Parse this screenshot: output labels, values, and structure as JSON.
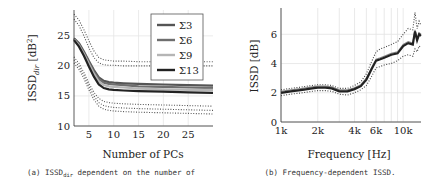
{
  "chart_data": [
    {
      "type": "line",
      "panel": "a",
      "caption": "(a) ISSD_dir dependent on the number of",
      "caption_parts": {
        "prefix": "(a) ISSD",
        "sub": "dir",
        "suffix": " dependent on the number of"
      },
      "xlabel": "Number of PCs",
      "ylabel": "ISSD_dir [dB^2]",
      "ylabel_parts": {
        "main": "ISSD",
        "sub": "dir",
        "unit": " [dB",
        "sup": "2",
        "close": "]"
      },
      "xlim": [
        2,
        30
      ],
      "ylim": [
        10,
        29.3
      ],
      "xticks": [
        5,
        10,
        15,
        20,
        25
      ],
      "yticks": [
        10,
        15,
        20,
        25
      ],
      "grid": true,
      "legend_position": "upper right",
      "x": [
        2,
        3,
        4,
        5,
        6,
        7,
        8,
        9,
        10,
        12,
        15,
        20,
        25,
        30
      ],
      "series": [
        {
          "name": "Σ3",
          "color": "#555555",
          "values": [
            24.6,
            23.8,
            22.4,
            20.8,
            19.3,
            18.1,
            17.5,
            17.3,
            17.2,
            17.1,
            17.0,
            16.9,
            16.8,
            16.7
          ]
        },
        {
          "name": "Σ6",
          "color": "#6e6e6e",
          "values": [
            24.5,
            23.6,
            22.2,
            20.6,
            19.0,
            17.8,
            17.2,
            17.0,
            16.9,
            16.8,
            16.6,
            16.5,
            16.4,
            16.3
          ]
        },
        {
          "name": "Σ9",
          "color": "#b5b5b5",
          "values": [
            24.4,
            23.4,
            22.0,
            20.3,
            18.7,
            17.4,
            16.8,
            16.6,
            16.5,
            16.4,
            16.2,
            16.1,
            16.0,
            16.0
          ]
        },
        {
          "name": "Σ13",
          "color": "#222222",
          "values": [
            24.3,
            23.2,
            21.7,
            19.9,
            18.2,
            16.9,
            16.3,
            16.1,
            16.0,
            15.9,
            15.8,
            15.7,
            15.6,
            15.5
          ]
        }
      ],
      "bounds_dotted": [
        {
          "name": "upper bound A",
          "values": [
            28.6,
            27.6,
            26.0,
            24.2,
            22.5,
            21.4,
            21.0,
            20.9,
            20.8,
            20.8,
            20.7,
            20.7,
            20.7,
            20.7
          ]
        },
        {
          "name": "upper bound B",
          "values": [
            27.8,
            26.7,
            25.0,
            23.0,
            21.4,
            20.5,
            20.2,
            20.1,
            20.1,
            20.0,
            20.0,
            20.0,
            20.0,
            20.0
          ]
        },
        {
          "name": "lower bound A",
          "values": [
            21.5,
            20.4,
            18.9,
            17.1,
            15.6,
            14.6,
            14.1,
            13.9,
            13.8,
            13.7,
            13.6,
            13.5,
            13.4,
            13.3
          ]
        },
        {
          "name": "lower bound B",
          "values": [
            21.0,
            19.9,
            18.4,
            16.6,
            15.0,
            13.9,
            13.4,
            13.2,
            13.1,
            13.0,
            12.9,
            12.8,
            12.7,
            12.6
          ]
        },
        {
          "name": "lower bound C",
          "values": [
            20.5,
            19.4,
            17.9,
            16.0,
            14.4,
            13.3,
            12.8,
            12.6,
            12.5,
            12.4,
            12.3,
            12.2,
            12.1,
            12.0
          ]
        }
      ]
    },
    {
      "type": "line",
      "panel": "b",
      "caption": "(b) Frequency-dependent ISSD.",
      "xlabel": "Frequency [Hz]",
      "ylabel": "ISSD [dB]",
      "xscale": "log",
      "xlim": [
        1000,
        14000
      ],
      "ylim": [
        0,
        7.8
      ],
      "xticks": [
        1000,
        2000,
        4000,
        6000,
        10000
      ],
      "xticklabels": [
        "1k",
        "2k",
        "4k",
        "6k",
        "10k"
      ],
      "yticks": [
        0,
        2,
        4,
        6
      ],
      "grid": true,
      "x": [
        1000,
        1200,
        1500,
        1800,
        2000,
        2300,
        2600,
        3000,
        3500,
        4000,
        4500,
        5000,
        5500,
        6000,
        6500,
        7000,
        8000,
        9000,
        10000,
        11000,
        12000,
        12500,
        13000,
        13500,
        14000
      ],
      "series": [
        {
          "name": "mean",
          "color": "#222222",
          "values": [
            2.0,
            2.1,
            2.2,
            2.3,
            2.35,
            2.35,
            2.3,
            2.1,
            2.1,
            2.25,
            2.45,
            2.9,
            3.6,
            4.2,
            4.3,
            4.4,
            4.6,
            4.7,
            5.2,
            5.4,
            5.3,
            6.2,
            5.6,
            6.0,
            5.9
          ]
        }
      ],
      "bounds_dotted": [
        {
          "name": "upper bound",
          "values": [
            2.2,
            2.3,
            2.4,
            2.5,
            2.55,
            2.55,
            2.5,
            2.3,
            2.3,
            2.5,
            2.75,
            3.3,
            4.1,
            4.8,
            5.0,
            5.1,
            5.3,
            5.5,
            6.0,
            6.4,
            6.3,
            7.5,
            6.4,
            6.9,
            6.6
          ]
        },
        {
          "name": "lower bound",
          "values": [
            1.8,
            1.9,
            2.0,
            2.1,
            2.15,
            2.15,
            2.1,
            1.9,
            1.85,
            2.0,
            2.2,
            2.5,
            3.1,
            3.7,
            3.8,
            3.9,
            4.0,
            4.2,
            4.5,
            4.6,
            4.5,
            5.0,
            4.8,
            5.2,
            5.1
          ]
        }
      ]
    }
  ]
}
